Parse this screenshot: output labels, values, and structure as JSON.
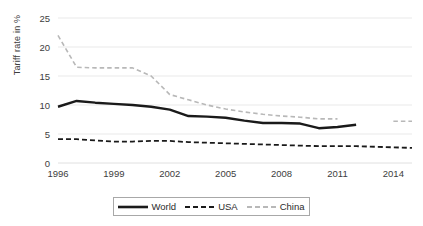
{
  "chart_data": {
    "type": "line",
    "title": "",
    "xlabel": "",
    "ylabel": "Tariff rate in %",
    "ylim": [
      0,
      25
    ],
    "xlim": [
      1996,
      2015
    ],
    "grid": true,
    "legend_position": "bottom",
    "y_ticks": [
      "0",
      "5",
      "10",
      "15",
      "20",
      "25"
    ],
    "y_tick_values": [
      0,
      5,
      10,
      15,
      20,
      25
    ],
    "x_ticks": [
      "1996",
      "1999",
      "2002",
      "2005",
      "2008",
      "2011",
      "2014"
    ],
    "x_tick_values": [
      1996,
      1999,
      2002,
      2005,
      2008,
      2011,
      2014
    ],
    "x": [
      1996,
      1997,
      1998,
      1999,
      2000,
      2001,
      2002,
      2003,
      2004,
      2005,
      2006,
      2007,
      2008,
      2009,
      2010,
      2011,
      2012,
      2013,
      2014,
      2015
    ],
    "series": [
      {
        "name": "World",
        "color": "#1a1a1a",
        "style": "solid",
        "width": 2.4,
        "values": [
          9.7,
          10.7,
          10.4,
          10.2,
          10.0,
          9.7,
          9.2,
          8.1,
          8.0,
          7.8,
          7.3,
          6.9,
          6.9,
          6.8,
          6.0,
          6.2,
          6.6,
          null,
          null,
          null
        ]
      },
      {
        "name": "USA",
        "color": "#1a1a1a",
        "style": "dashed",
        "width": 1.8,
        "values": [
          4.1,
          4.1,
          3.9,
          3.7,
          3.7,
          3.8,
          3.8,
          3.6,
          3.5,
          3.4,
          3.3,
          3.2,
          3.1,
          3.0,
          2.9,
          2.9,
          2.9,
          2.8,
          2.7,
          2.6
        ]
      },
      {
        "name": "China",
        "color": "#b8b8b8",
        "style": "dashed",
        "width": 1.6,
        "values": [
          22.0,
          16.5,
          16.4,
          16.4,
          16.4,
          15.0,
          11.8,
          10.9,
          10.0,
          9.3,
          8.8,
          8.4,
          8.1,
          7.9,
          7.6,
          7.6,
          null,
          null,
          7.2,
          7.2
        ]
      }
    ]
  },
  "legend": {
    "entries": [
      {
        "label": "World",
        "icon": "solid-line-swatch"
      },
      {
        "label": "USA",
        "icon": "dashed-line-swatch"
      },
      {
        "label": "China",
        "icon": "light-dashed-line-swatch"
      }
    ]
  }
}
